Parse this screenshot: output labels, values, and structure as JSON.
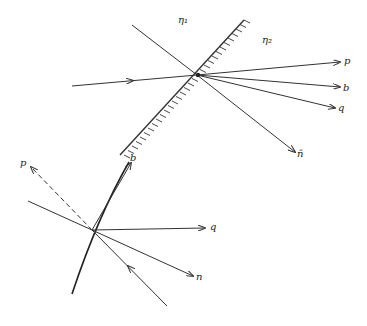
{
  "diagram": {
    "type": "ray refraction geometry",
    "stroke_color": "#333333",
    "background": "#ffffff",
    "top_figure": {
      "media_labels": {
        "eta1": "η₁",
        "eta2": "η₂"
      },
      "ray_labels": {
        "p": "p",
        "b": "b",
        "q": "q",
        "n_hat": "n̂"
      }
    },
    "bottom_figure": {
      "ray_labels": {
        "p": "p",
        "b": "b",
        "q": "q",
        "n": "n"
      }
    }
  }
}
